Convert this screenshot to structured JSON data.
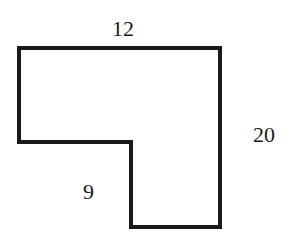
{
  "figure": {
    "type": "L-shaped polygon",
    "stroke_color": "#1a1a1a",
    "fill_color": "#ffffff",
    "labels": {
      "top": "12",
      "right": "20",
      "bottom_left": "9"
    },
    "vertices": [
      [
        19,
        48
      ],
      [
        220,
        48
      ],
      [
        220,
        227
      ],
      [
        131,
        227
      ],
      [
        131,
        142
      ],
      [
        19,
        142
      ]
    ]
  }
}
